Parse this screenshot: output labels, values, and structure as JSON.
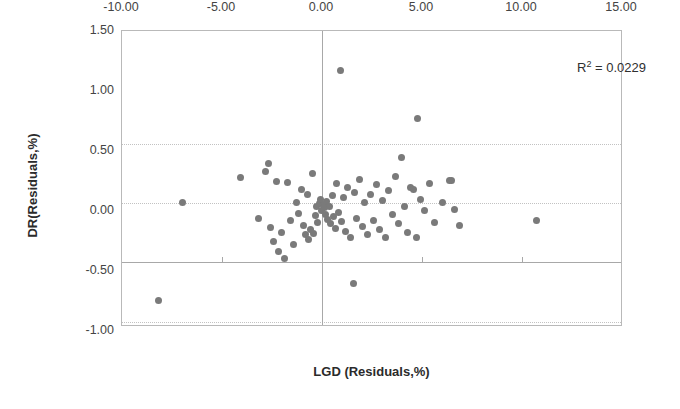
{
  "chart_data": {
    "type": "scatter",
    "title": "",
    "xlabel": "LGD (Residuals,%)",
    "ylabel": "DR(Residuals,%)",
    "xlim": [
      -10.0,
      15.0
    ],
    "ylim": [
      -1.0,
      1.5
    ],
    "xticks": [
      "-10.00",
      "-5.00",
      "0.00",
      "5.00",
      "10.00",
      "15.00"
    ],
    "xtick_values": [
      -10.0,
      -5.0,
      0.0,
      5.0,
      10.0,
      15.0
    ],
    "yticks": [
      "1.50",
      "1.00",
      "0.50",
      "0.00",
      "-0.50",
      "-1.00"
    ],
    "ytick_values": [
      1.5,
      1.0,
      0.5,
      0.0,
      -0.5,
      -1.0
    ],
    "grid": "horizontal-dotted",
    "legend": "none",
    "marker_color": "#7a7a7a",
    "marker_size": 7,
    "annotations": [
      {
        "name": "r-squared",
        "text": "R² = 0.0229",
        "value": 0.0229
      }
    ],
    "points": [
      [
        -8.2,
        -0.78
      ],
      [
        -7.0,
        0.05
      ],
      [
        -4.1,
        0.26
      ],
      [
        -3.2,
        -0.08
      ],
      [
        -2.85,
        0.31
      ],
      [
        -2.7,
        0.38
      ],
      [
        -2.6,
        -0.16
      ],
      [
        -2.45,
        -0.28
      ],
      [
        -2.3,
        0.23
      ],
      [
        -2.2,
        -0.36
      ],
      [
        -2.05,
        -0.2
      ],
      [
        -1.9,
        -0.42
      ],
      [
        -1.75,
        0.22
      ],
      [
        -1.6,
        -0.1
      ],
      [
        -1.45,
        -0.3
      ],
      [
        -1.3,
        0.05
      ],
      [
        -1.2,
        -0.04
      ],
      [
        -1.05,
        0.16
      ],
      [
        -0.95,
        -0.14
      ],
      [
        -0.85,
        -0.22
      ],
      [
        -0.75,
        0.12
      ],
      [
        -0.7,
        -0.26
      ],
      [
        -0.6,
        -0.18
      ],
      [
        -0.5,
        0.3
      ],
      [
        -0.45,
        -0.21
      ],
      [
        -0.35,
        -0.06
      ],
      [
        -0.3,
        0.02
      ],
      [
        -0.25,
        -0.12
      ],
      [
        -0.15,
        0.04
      ],
      [
        -0.1,
        0.08
      ],
      [
        -0.05,
        -0.02
      ],
      [
        0.05,
        0.03
      ],
      [
        0.1,
        0.01
      ],
      [
        0.15,
        -0.05
      ],
      [
        0.2,
        0.06
      ],
      [
        0.25,
        -0.09
      ],
      [
        0.35,
        0.02
      ],
      [
        0.4,
        -0.13
      ],
      [
        0.5,
        0.11
      ],
      [
        0.55,
        -0.07
      ],
      [
        0.65,
        -0.17
      ],
      [
        0.7,
        0.21
      ],
      [
        0.8,
        -0.03
      ],
      [
        0.9,
        1.17
      ],
      [
        0.95,
        -0.11
      ],
      [
        1.05,
        0.09
      ],
      [
        1.15,
        -0.19
      ],
      [
        1.25,
        0.18
      ],
      [
        1.4,
        -0.24
      ],
      [
        1.55,
        -0.63
      ],
      [
        1.6,
        0.14
      ],
      [
        1.7,
        -0.08
      ],
      [
        1.85,
        0.25
      ],
      [
        2.0,
        -0.15
      ],
      [
        2.1,
        0.05
      ],
      [
        2.25,
        -0.22
      ],
      [
        2.4,
        0.12
      ],
      [
        2.55,
        -0.1
      ],
      [
        2.7,
        0.2
      ],
      [
        2.85,
        -0.18
      ],
      [
        3.0,
        0.07
      ],
      [
        3.15,
        -0.24
      ],
      [
        3.3,
        0.15
      ],
      [
        3.5,
        -0.05
      ],
      [
        3.65,
        0.27
      ],
      [
        3.8,
        -0.13
      ],
      [
        3.95,
        0.43
      ],
      [
        4.1,
        0.02
      ],
      [
        4.25,
        -0.2
      ],
      [
        4.4,
        0.18
      ],
      [
        4.55,
        0.16
      ],
      [
        4.7,
        -0.24
      ],
      [
        4.75,
        0.76
      ],
      [
        4.9,
        0.08
      ],
      [
        5.1,
        -0.02
      ],
      [
        5.35,
        0.21
      ],
      [
        5.6,
        -0.12
      ],
      [
        6.0,
        0.05
      ],
      [
        6.35,
        0.24
      ],
      [
        6.45,
        0.24
      ],
      [
        6.6,
        -0.01
      ],
      [
        6.85,
        -0.14
      ],
      [
        10.7,
        -0.1
      ]
    ]
  }
}
